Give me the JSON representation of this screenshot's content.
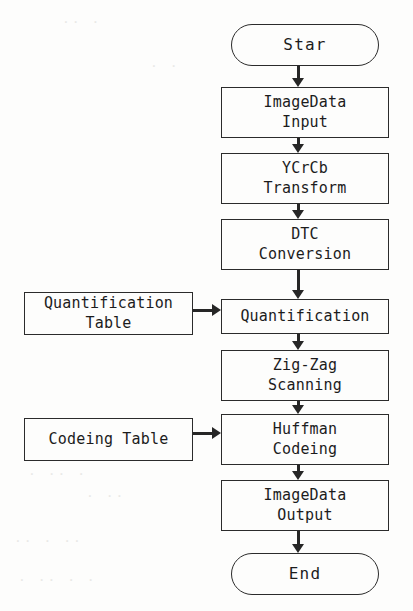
{
  "diagram": {
    "colors": {
      "background": "#fdfdfc",
      "stroke": "#2b2b2b",
      "arrow": "#262626",
      "text": "#1c1c1c"
    },
    "nodes": [
      {
        "id": "start",
        "shape": "terminal",
        "lines": [
          "Star"
        ],
        "x": 231,
        "y": 24,
        "w": 148,
        "h": 42
      },
      {
        "id": "image_in",
        "shape": "process",
        "lines": [
          "ImageData",
          "Input"
        ],
        "x": 221,
        "y": 87,
        "w": 168,
        "h": 51
      },
      {
        "id": "ycrcb",
        "shape": "process",
        "lines": [
          "YCrCb",
          "Transform"
        ],
        "x": 221,
        "y": 153,
        "w": 168,
        "h": 51
      },
      {
        "id": "dtc",
        "shape": "process",
        "lines": [
          "DTC",
          "Conversion"
        ],
        "x": 221,
        "y": 219,
        "w": 168,
        "h": 51
      },
      {
        "id": "quant_table",
        "shape": "process",
        "lines": [
          "Quantification",
          "Table"
        ],
        "x": 24,
        "y": 292,
        "w": 169,
        "h": 43
      },
      {
        "id": "quantification",
        "shape": "process",
        "lines": [
          "Quantification"
        ],
        "x": 221,
        "y": 299,
        "w": 168,
        "h": 35
      },
      {
        "id": "zigzag",
        "shape": "process",
        "lines": [
          "Zig-Zag",
          "Scanning"
        ],
        "x": 221,
        "y": 350,
        "w": 168,
        "h": 51
      },
      {
        "id": "codeing_table",
        "shape": "process",
        "lines": [
          "Codeing Table"
        ],
        "x": 24,
        "y": 418,
        "w": 169,
        "h": 43
      },
      {
        "id": "huffman",
        "shape": "process",
        "lines": [
          "Huffman",
          "Codeing"
        ],
        "x": 221,
        "y": 414,
        "w": 168,
        "h": 51
      },
      {
        "id": "image_out",
        "shape": "process",
        "lines": [
          "ImageData",
          "Output"
        ],
        "x": 221,
        "y": 480,
        "w": 168,
        "h": 51
      },
      {
        "id": "end",
        "shape": "terminal",
        "lines": [
          "End"
        ],
        "x": 231,
        "y": 553,
        "w": 148,
        "h": 42
      }
    ],
    "connectors": [
      {
        "id": "start-to-image_in",
        "dir": "down",
        "x": 298,
        "y": 66,
        "len": 21
      },
      {
        "id": "image_in-to-ycrcb",
        "dir": "down",
        "x": 298,
        "y": 138,
        "len": 15
      },
      {
        "id": "ycrcb-to-dtc",
        "dir": "down",
        "x": 298,
        "y": 204,
        "len": 15
      },
      {
        "id": "dtc-to-quantification",
        "dir": "down",
        "x": 298,
        "y": 270,
        "len": 29
      },
      {
        "id": "quantification-to-zigzag",
        "dir": "down",
        "x": 298,
        "y": 334,
        "len": 16
      },
      {
        "id": "zigzag-to-huffman",
        "dir": "down",
        "x": 298,
        "y": 401,
        "len": 13
      },
      {
        "id": "huffman-to-image_out",
        "dir": "down",
        "x": 298,
        "y": 465,
        "len": 15
      },
      {
        "id": "image_out-to-end",
        "dir": "down",
        "x": 298,
        "y": 531,
        "len": 22
      },
      {
        "id": "quant_table-to-quantification",
        "dir": "right",
        "x": 193,
        "y": 310,
        "len": 28
      },
      {
        "id": "codeing_table-to-huffman",
        "dir": "right",
        "x": 193,
        "y": 433,
        "len": 28
      }
    ],
    "artifacts": [
      {
        "id": "bleed-1",
        "text": "· ·· ·",
        "x": 28,
        "y": 466
      },
      {
        "id": "bleed-2",
        "text": "·· ·  ··",
        "x": 14,
        "y": 533
      },
      {
        "id": "bleed-3",
        "text": "· ·· · ·",
        "x": 18,
        "y": 572
      },
      {
        "id": "bleed-4",
        "text": "· ··",
        "x": 86,
        "y": 488
      },
      {
        "id": "bleed-5",
        "text": "·· ·",
        "x": 62,
        "y": 14
      },
      {
        "id": "bleed-6",
        "text": "· ·",
        "x": 150,
        "y": 58
      }
    ]
  }
}
